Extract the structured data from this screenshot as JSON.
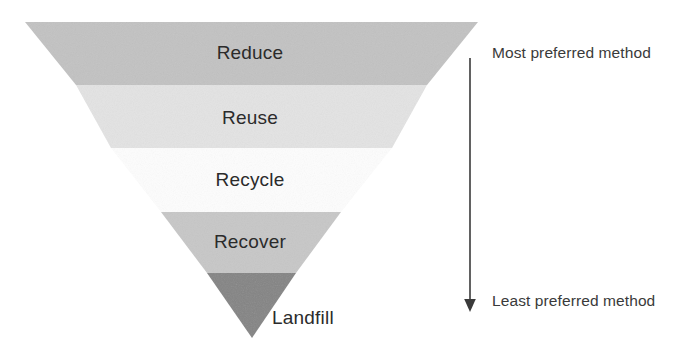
{
  "diagram": {
    "type": "inverted-funnel",
    "canvas": {
      "width": 689,
      "height": 347,
      "background": "#ffffff"
    }
  },
  "funnel": {
    "bands": [
      {
        "id": "reduce",
        "label": "Reduce",
        "rank": 1,
        "color": "#c2c2c2",
        "label_x": 250,
        "label_y": 53,
        "top_y": 22,
        "bottom_y": 85,
        "top_left_x": 25,
        "top_right_x": 478,
        "bottom_left_x": 76,
        "bottom_right_x": 427
      },
      {
        "id": "reuse",
        "label": "Reuse",
        "rank": 2,
        "color": "#e3e3e3",
        "label_x": 250,
        "label_y": 118,
        "top_y": 85,
        "bottom_y": 148,
        "top_left_x": 76,
        "top_right_x": 427,
        "bottom_left_x": 111,
        "bottom_right_x": 392
      },
      {
        "id": "recycle",
        "label": "Recycle",
        "rank": 3,
        "color": "#fdfdfd",
        "label_x": 250,
        "label_y": 180,
        "top_y": 148,
        "bottom_y": 212,
        "top_left_x": 111,
        "top_right_x": 392,
        "bottom_left_x": 161,
        "bottom_right_x": 341
      },
      {
        "id": "recover",
        "label": "Recover",
        "rank": 4,
        "color": "#c7c7c7",
        "label_x": 250,
        "label_y": 242,
        "top_y": 212,
        "bottom_y": 273,
        "top_left_x": 161,
        "top_right_x": 341,
        "bottom_left_x": 207,
        "bottom_right_x": 296
      },
      {
        "id": "landfill",
        "label": "Landfill",
        "rank": 5,
        "color": "#848484",
        "label_x": 272,
        "label_y": 318,
        "top_y": 273,
        "bottom_y": 338,
        "top_left_x": 207,
        "top_right_x": 296,
        "apex_x": 252
      }
    ]
  },
  "preference_axis": {
    "orientation": "vertical",
    "direction": "downward",
    "line_color": "#3a3a3a",
    "top_label": "Most preferred method",
    "bottom_label": "Least preferred method",
    "top_label_x": 492,
    "top_label_y": 52,
    "bottom_label_x": 492,
    "bottom_label_y": 300,
    "line_x": 470,
    "line_top_y": 58,
    "line_bottom_y": 312
  }
}
